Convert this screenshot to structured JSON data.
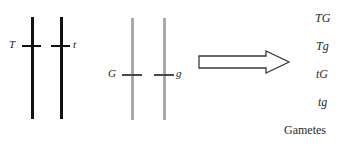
{
  "figure": {
    "type": "genetics-diagram",
    "background_color": "#ffffff"
  },
  "chromosome_pairs": [
    {
      "name": "Tt pair",
      "color": "#111111",
      "chromatids": [
        {
          "id": "chromatid-T",
          "allele_label": "T",
          "label_side": "left",
          "x": 31,
          "top": 17,
          "bottom": 119,
          "tick_y": 45,
          "tick_x": 22,
          "tick_width": 19,
          "label_x": 9,
          "label_y": 39
        },
        {
          "id": "chromatid-t",
          "allele_label": "t",
          "label_side": "right",
          "x": 60,
          "top": 17,
          "bottom": 119,
          "tick_y": 45,
          "tick_x": 51,
          "tick_width": 19,
          "label_x": 73,
          "label_y": 39
        }
      ]
    },
    {
      "name": "Gg pair",
      "color": "#a9a9a9",
      "chromatids": [
        {
          "id": "chromatid-G",
          "allele_label": "G",
          "label_side": "left",
          "x": 131,
          "top": 18,
          "bottom": 120,
          "tick_y": 74,
          "tick_x": 122,
          "tick_width": 20,
          "label_x": 108,
          "label_y": 68
        },
        {
          "id": "chromatid-g",
          "allele_label": "g",
          "label_side": "right",
          "x": 163,
          "top": 18,
          "bottom": 120,
          "tick_y": 74,
          "tick_x": 154,
          "tick_width": 20,
          "label_x": 176,
          "label_y": 68
        }
      ]
    }
  ],
  "arrow": {
    "name": "produces-arrow",
    "direction": "right",
    "style": "hollow-block",
    "outline_color": "#3a3a3a",
    "fill_color": "#ffffff",
    "x": 198,
    "y": 50,
    "width": 92,
    "height": 24
  },
  "gametes": {
    "caption": "Gametes",
    "caption_x": 284,
    "caption_y": 124,
    "items": [
      {
        "label": "TG",
        "x": 315,
        "y": 12
      },
      {
        "label": "Tg",
        "x": 316,
        "y": 40
      },
      {
        "label": "tG",
        "x": 316,
        "y": 68
      },
      {
        "label": "tg",
        "x": 318,
        "y": 96
      }
    ]
  }
}
